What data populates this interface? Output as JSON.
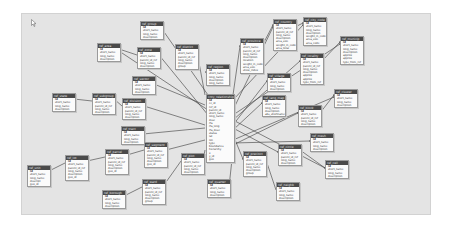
{
  "diagram": {
    "type": "database-schema",
    "canvas_bg": "#e4e4e4",
    "header_bg": "#4a4a4a",
    "center_table": {
      "name": "cnty_relationships",
      "fields": [
        "id",
        "cc_id",
        "ref_id",
        "parent_id",
        "short_name",
        "long_name",
        "desc",
        "rfa",
        "rfa_long",
        "rfa_desc",
        "status",
        "lat",
        "lon",
        "type",
        "boundaries",
        "hierarchy",
        "x",
        "y_id",
        "geo"
      ]
    },
    "tables": [
      {
        "id": "t1",
        "name": "ref_group",
        "x": 140,
        "y": 21,
        "fields": [
          "id",
          "short_name",
          "long_name",
          "description"
        ]
      },
      {
        "id": "t2",
        "name": "ref_area",
        "x": 97,
        "y": 43,
        "fields": [
          "id",
          "short_name",
          "long_name",
          "description"
        ]
      },
      {
        "id": "t3",
        "name": "ref_zone",
        "x": 137,
        "y": 47,
        "fields": [
          "id",
          "short_name",
          "parent_id_ref",
          "long_name",
          "description"
        ]
      },
      {
        "id": "t4",
        "name": "ref_district",
        "x": 175,
        "y": 44,
        "fields": [
          "id",
          "short_name",
          "parent_id_ref",
          "long_name",
          "description",
          "group"
        ]
      },
      {
        "id": "t5",
        "name": "ref_region",
        "x": 206,
        "y": 64,
        "fields": [
          "id",
          "short_name",
          "long_name",
          "description",
          "long_name"
        ]
      },
      {
        "id": "t6",
        "name": "ref_province",
        "x": 240,
        "y": 38,
        "fields": [
          "id",
          "short_name",
          "parent_id_ref",
          "long_name",
          "description",
          "location",
          "weight_in_code",
          "area_size",
          "show_index"
        ]
      },
      {
        "id": "t7",
        "name": "ref_country",
        "x": 273,
        "y": 19,
        "fields": [
          "id",
          "short_name",
          "parent_id_ref",
          "long_name",
          "description",
          "area_size",
          "weight_in_code",
          "area_total"
        ]
      },
      {
        "id": "t8",
        "name": "ref_city_code",
        "x": 303,
        "y": 17,
        "fields": [
          "id",
          "short_name",
          "long_name",
          "description",
          "weight_in_code",
          "area_size",
          "area_code"
        ]
      },
      {
        "id": "t9",
        "name": "ref_municip",
        "x": 340,
        "y": 36,
        "fields": [
          "id",
          "short_name",
          "long_name",
          "description",
          "approx",
          "approx",
          "type_from_ref"
        ]
      },
      {
        "id": "t10",
        "name": "ref_locality",
        "x": 300,
        "y": 53,
        "fields": [
          "id",
          "short_name",
          "parent_id_ref",
          "long_name",
          "description",
          "approx",
          "approx",
          "type_from_ref"
        ]
      },
      {
        "id": "t11",
        "name": "ref_village",
        "x": 267,
        "y": 73,
        "fields": [
          "id",
          "short_name",
          "long_name",
          "description"
        ]
      },
      {
        "id": "t12",
        "name": "ref_sector",
        "x": 132,
        "y": 76,
        "fields": [
          "id",
          "short_name",
          "long_name",
          "description"
        ]
      },
      {
        "id": "t13",
        "name": "ref_state",
        "x": 52,
        "y": 93,
        "fields": [
          "id",
          "short_name",
          "long_name",
          "description"
        ]
      },
      {
        "id": "t14",
        "name": "ref_subgroup",
        "x": 92,
        "y": 93,
        "fields": [
          "id",
          "short_name",
          "parent_id_ref",
          "long_name",
          "description"
        ]
      },
      {
        "id": "t15",
        "name": "ref_division",
        "x": 122,
        "y": 98,
        "fields": [
          "id",
          "short_name",
          "parent_id_ref",
          "long_name",
          "description"
        ]
      },
      {
        "id": "t16",
        "name": "ref_lang_map",
        "x": 262,
        "y": 95,
        "fields": [
          "id",
          "short_name",
          "long_name",
          "description",
          "abs_shortname"
        ]
      },
      {
        "id": "t17",
        "name": "ref_cluster",
        "x": 334,
        "y": 89,
        "fields": [
          "id",
          "short_name",
          "long_name",
          "description"
        ]
      },
      {
        "id": "t18",
        "name": "ref_block",
        "x": 298,
        "y": 105,
        "fields": [
          "id",
          "short_name",
          "parent_id_ref",
          "long_name",
          "description"
        ]
      },
      {
        "id": "t19",
        "name": "ref_tract",
        "x": 121,
        "y": 126,
        "fields": [
          "id",
          "short_name",
          "long_name",
          "description"
        ]
      },
      {
        "id": "t20",
        "name": "ref_segment",
        "x": 144,
        "y": 142,
        "fields": [
          "id",
          "short_name",
          "parent_id_ref",
          "long_name",
          "description",
          "geo_id"
        ]
      },
      {
        "id": "t21",
        "name": "ref_parcel",
        "x": 105,
        "y": 149,
        "fields": [
          "id",
          "short_name",
          "parent_id_ref",
          "long_name",
          "description",
          "geo_id"
        ]
      },
      {
        "id": "t22",
        "name": "ref_lot",
        "x": 65,
        "y": 155,
        "fields": [
          "id",
          "short_name",
          "parent_id_ref",
          "long_name",
          "description",
          "geo_id"
        ]
      },
      {
        "id": "t23",
        "name": "ref_unit",
        "x": 27,
        "y": 165,
        "fields": [
          "id",
          "short_name",
          "long_name",
          "descript",
          "geo_id"
        ]
      },
      {
        "id": "t24",
        "name": "ref_plot",
        "x": 181,
        "y": 153,
        "fields": [
          "id",
          "short_name",
          "parent_id_ref",
          "long_name",
          "description"
        ]
      },
      {
        "id": "t25",
        "name": "ref_ward",
        "x": 142,
        "y": 179,
        "fields": [
          "id",
          "short_name",
          "parent_id_ref",
          "long_name",
          "description",
          "group"
        ]
      },
      {
        "id": "t26",
        "name": "ref_borough",
        "x": 102,
        "y": 190,
        "fields": [
          "id",
          "short_name",
          "long_name",
          "description"
        ]
      },
      {
        "id": "t27",
        "name": "ref_quarter",
        "x": 207,
        "y": 179,
        "fields": [
          "id",
          "short_name",
          "long_name",
          "description"
        ]
      },
      {
        "id": "t28",
        "name": "ref_precinct",
        "x": 243,
        "y": 151,
        "fields": [
          "id",
          "short_name",
          "parent_id_ref",
          "long_name",
          "description",
          "group"
        ]
      },
      {
        "id": "t29",
        "name": "ref_neighb",
        "x": 276,
        "y": 182,
        "fields": [
          "id",
          "short_name",
          "long_name",
          "description"
        ]
      },
      {
        "id": "t30",
        "name": "ref_circle",
        "x": 278,
        "y": 144,
        "fields": [
          "id",
          "short_name",
          "parent_id_ref",
          "long_name",
          "description"
        ]
      },
      {
        "id": "t31",
        "name": "ref_mesh",
        "x": 310,
        "y": 133,
        "fields": [
          "id",
          "short_name",
          "long_name",
          "description"
        ]
      },
      {
        "id": "t32",
        "name": "ref_cell",
        "x": 325,
        "y": 160,
        "fields": [
          "id",
          "short_name",
          "long_name",
          "description"
        ]
      }
    ],
    "links": [
      [
        "t1",
        208,
        95
      ],
      [
        "t2",
        208,
        110
      ],
      [
        "t3",
        208,
        115
      ],
      [
        "t4",
        205,
        95
      ],
      [
        "t5",
        208,
        75
      ],
      [
        "t6",
        233,
        95
      ],
      [
        "t7",
        233,
        110
      ],
      [
        "t8",
        233,
        100
      ],
      [
        "t9",
        233,
        115
      ],
      [
        "t10",
        233,
        120
      ],
      [
        "t11",
        233,
        125
      ],
      [
        "t12",
        205,
        105
      ],
      [
        "t15",
        205,
        125
      ],
      [
        "t16",
        233,
        130
      ],
      [
        "t17",
        233,
        140
      ],
      [
        "t18",
        233,
        145
      ],
      [
        "t19",
        205,
        128
      ],
      [
        "t20",
        205,
        140
      ],
      [
        "t24",
        205,
        150
      ],
      [
        "t27",
        233,
        150
      ],
      [
        "t28",
        233,
        135
      ],
      [
        "t30",
        233,
        128
      ],
      [
        "t31",
        233,
        143
      ],
      [
        "t32",
        233,
        120
      ]
    ],
    "chain_links": [
      [
        "t13",
        "t14"
      ],
      [
        "t14",
        "t15"
      ],
      [
        "t23",
        "t22"
      ],
      [
        "t22",
        "t21"
      ],
      [
        "t21",
        "t20"
      ],
      [
        "t26",
        "t25"
      ],
      [
        "t25",
        "t24"
      ],
      [
        "t2",
        "t3"
      ],
      [
        "t7",
        "t6"
      ],
      [
        "t8",
        "t7"
      ],
      [
        "t9",
        "t10"
      ],
      [
        "t28",
        "t29"
      ],
      [
        "t30",
        "t32"
      ],
      [
        "t17",
        "t18"
      ]
    ]
  }
}
